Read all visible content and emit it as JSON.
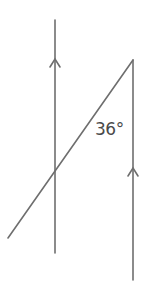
{
  "diagram": {
    "type": "parallel-lines-transversal",
    "angle_label": "36°",
    "line_color": "#6e6e6e",
    "text_color": "#4a4a4a",
    "lines": {
      "left_parallel": {
        "x1": 55,
        "y1": 20,
        "x2": 55,
        "y2": 253
      },
      "right_parallel": {
        "x1": 133,
        "y1": 60,
        "x2": 133,
        "y2": 280
      },
      "transversal": {
        "x1": 133,
        "y1": 60,
        "x2": 8,
        "y2": 238
      }
    },
    "arrows": [
      {
        "name": "left-parallel-arrow",
        "x": 55,
        "y": 59,
        "direction": "up"
      },
      {
        "name": "right-parallel-arrow",
        "x": 133,
        "y": 168,
        "direction": "up"
      }
    ]
  }
}
